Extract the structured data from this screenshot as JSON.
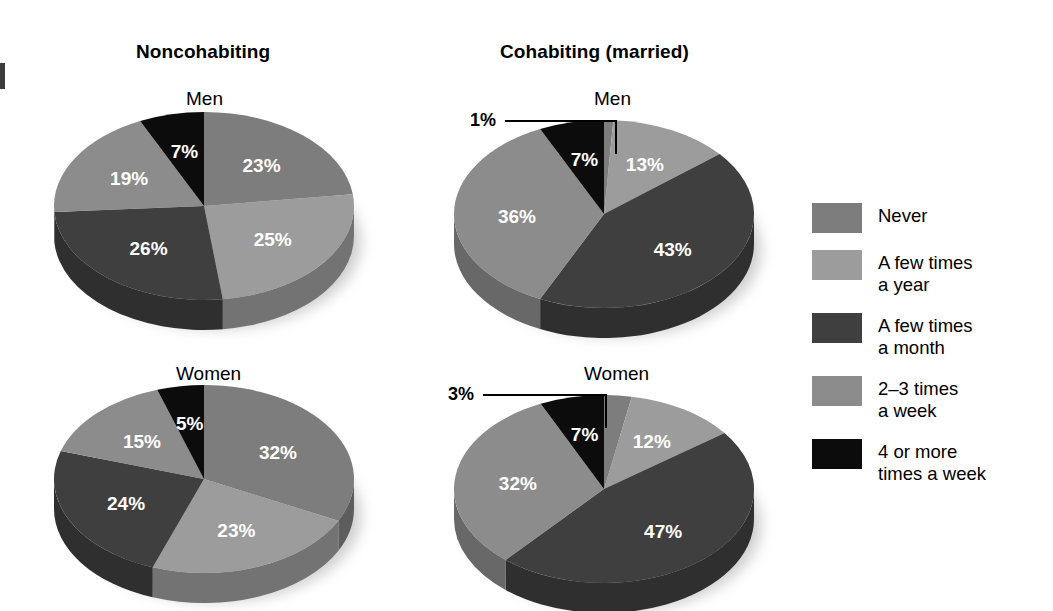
{
  "figure": {
    "column_titles": {
      "left": "Noncohabiting",
      "right": "Cohabiting (married)"
    },
    "row_titles": {
      "top_left": "Men",
      "top_right": "Men",
      "bottom_left": "Women",
      "bottom_right": "Women"
    }
  },
  "legend": {
    "position": "right",
    "items": [
      {
        "label": "Never",
        "color": "#7d7d7d"
      },
      {
        "label": "A few times\na year",
        "color": "#9c9c9c"
      },
      {
        "label": "A few times\na month",
        "color": "#3f3f3f"
      },
      {
        "label": "2–3 times\na week",
        "color": "#8c8c8c"
      },
      {
        "label": "4 or more\ntimes a week",
        "color": "#0c0c0c"
      }
    ]
  },
  "colors": {
    "never": "#7d7d7d",
    "few_times_year": "#9c9c9c",
    "few_times_month": "#3f3f3f",
    "two_three_week": "#8c8c8c",
    "four_or_more_week": "#0c0c0c",
    "background": "#ffffff",
    "text": "#000000",
    "label_text": "#ffffff"
  },
  "chart_data": [
    {
      "type": "pie",
      "title": "Noncohabiting — Men",
      "group": "Noncohabiting",
      "sex": "Men",
      "labels": [
        "Never",
        "A few times a year",
        "A few times a month",
        "2–3 times a week",
        "4 or more times a week"
      ],
      "values": [
        23,
        25,
        26,
        19,
        7
      ],
      "value_labels": [
        "23%",
        "25%",
        "26%",
        "19%",
        "7%"
      ],
      "colors": [
        "#7d7d7d",
        "#9c9c9c",
        "#3f3f3f",
        "#8c8c8c",
        "#0c0c0c"
      ],
      "start_angle_deg": 0,
      "direction": "clockwise",
      "units": "percent"
    },
    {
      "type": "pie",
      "title": "Cohabiting (married) — Men",
      "group": "Cohabiting (married)",
      "sex": "Men",
      "labels": [
        "Never",
        "A few times a year",
        "A few times a month",
        "2–3 times a week",
        "4 or more times a week"
      ],
      "values": [
        1,
        13,
        43,
        36,
        7
      ],
      "value_labels": [
        "1%",
        "13%",
        "43%",
        "36%",
        "7%"
      ],
      "colors": [
        "#7d7d7d",
        "#9c9c9c",
        "#3f3f3f",
        "#8c8c8c",
        "#0c0c0c"
      ],
      "start_angle_deg": 0,
      "direction": "clockwise",
      "units": "percent",
      "callout": {
        "label": "1%",
        "for_slice": "Never"
      }
    },
    {
      "type": "pie",
      "title": "Noncohabiting — Women",
      "group": "Noncohabiting",
      "sex": "Women",
      "labels": [
        "Never",
        "A few times a year",
        "A few times a month",
        "2–3 times a week",
        "4 or more times a week"
      ],
      "values": [
        32,
        23,
        24,
        15,
        5
      ],
      "value_labels": [
        "32%",
        "23%",
        "24%",
        "15%",
        "5%"
      ],
      "colors": [
        "#7d7d7d",
        "#9c9c9c",
        "#3f3f3f",
        "#8c8c8c",
        "#0c0c0c"
      ],
      "start_angle_deg": 0,
      "direction": "clockwise",
      "units": "percent"
    },
    {
      "type": "pie",
      "title": "Cohabiting (married) — Women",
      "group": "Cohabiting (married)",
      "sex": "Women",
      "labels": [
        "Never",
        "A few times a year",
        "A few times a month",
        "2–3 times a week",
        "4 or more times a week"
      ],
      "values": [
        3,
        12,
        47,
        32,
        7
      ],
      "value_labels": [
        "3%",
        "12%",
        "47%",
        "32%",
        "7%"
      ],
      "colors": [
        "#7d7d7d",
        "#9c9c9c",
        "#3f3f3f",
        "#8c8c8c",
        "#0c0c0c"
      ],
      "start_angle_deg": 0,
      "direction": "clockwise",
      "units": "percent",
      "callout": {
        "label": "3%",
        "for_slice": "Never"
      }
    }
  ],
  "callouts": {
    "men": "1%",
    "women": "3%"
  }
}
